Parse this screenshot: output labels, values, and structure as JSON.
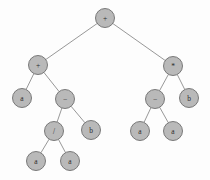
{
  "figure": {
    "name": "binary-expression-tree",
    "background_color": "#fdfdfd",
    "node_fill_color": "#b9b9b9",
    "node_stroke_color": "#6d6d6d",
    "edge_color": "#7e7e7e",
    "label_color": "#2b2b2b",
    "node_radius": 9.5
  },
  "chart_data": {
    "type": "diagram",
    "title": "",
    "nodes": [
      {
        "id": "n0",
        "label": "+",
        "x": 105,
        "y": 18,
        "depth": 0,
        "role": "root"
      },
      {
        "id": "n1",
        "label": "+",
        "x": 38,
        "y": 65,
        "depth": 1,
        "role": "internal"
      },
      {
        "id": "n2",
        "label": "*",
        "x": 173,
        "y": 66,
        "depth": 1,
        "role": "internal"
      },
      {
        "id": "n3",
        "label": "a",
        "x": 22,
        "y": 98,
        "depth": 2,
        "role": "leaf"
      },
      {
        "id": "n4",
        "label": "−",
        "x": 65,
        "y": 99,
        "depth": 2,
        "role": "internal"
      },
      {
        "id": "n5",
        "label": "−",
        "x": 155,
        "y": 99,
        "depth": 2,
        "role": "internal"
      },
      {
        "id": "n6",
        "label": "b",
        "x": 189,
        "y": 98,
        "depth": 2,
        "role": "leaf"
      },
      {
        "id": "n7",
        "label": "/",
        "x": 54,
        "y": 131,
        "depth": 3,
        "role": "internal"
      },
      {
        "id": "n8",
        "label": "b",
        "x": 91,
        "y": 130,
        "depth": 3,
        "role": "leaf"
      },
      {
        "id": "n9",
        "label": "a",
        "x": 140,
        "y": 131,
        "depth": 3,
        "role": "leaf"
      },
      {
        "id": "n10",
        "label": "a",
        "x": 173,
        "y": 131,
        "depth": 3,
        "role": "leaf"
      },
      {
        "id": "n11",
        "label": "a",
        "x": 36,
        "y": 161,
        "depth": 4,
        "role": "leaf"
      },
      {
        "id": "n12",
        "label": "a",
        "x": 70,
        "y": 161,
        "depth": 4,
        "role": "leaf"
      }
    ],
    "edges": [
      {
        "from": "n0",
        "to": "n1"
      },
      {
        "from": "n0",
        "to": "n2"
      },
      {
        "from": "n1",
        "to": "n3"
      },
      {
        "from": "n1",
        "to": "n4"
      },
      {
        "from": "n2",
        "to": "n5"
      },
      {
        "from": "n2",
        "to": "n6"
      },
      {
        "from": "n4",
        "to": "n7"
      },
      {
        "from": "n4",
        "to": "n8"
      },
      {
        "from": "n5",
        "to": "n9"
      },
      {
        "from": "n5",
        "to": "n10"
      },
      {
        "from": "n7",
        "to": "n11"
      },
      {
        "from": "n7",
        "to": "n12"
      }
    ]
  }
}
